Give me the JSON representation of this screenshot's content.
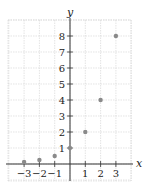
{
  "chart_data": {
    "type": "scatter",
    "title": "",
    "xlabel": "x",
    "ylabel": "y",
    "x": [
      -3,
      -2,
      -1,
      0,
      1,
      2,
      3
    ],
    "y": [
      0.125,
      0.25,
      0.5,
      1,
      2,
      4,
      8
    ],
    "series": [
      {
        "name": "y = 2^x",
        "x": [
          -3,
          -2,
          -1,
          0,
          1,
          2,
          3
        ],
        "values": [
          0.125,
          0.25,
          0.5,
          1,
          2,
          4,
          8
        ]
      }
    ],
    "x_ticks": [
      -3,
      -2,
      -1,
      1,
      2,
      3
    ],
    "y_ticks": [
      1,
      2,
      3,
      4,
      5,
      6,
      7,
      8
    ],
    "xlim": [
      -4.1,
      4
    ],
    "ylim": [
      -1,
      9
    ],
    "grid": true,
    "legend": "none",
    "colors": {
      "point": "#8a8a8a",
      "axis": "#333333",
      "grid": "#d8d8d8"
    }
  },
  "axes": {
    "x_label": "x",
    "y_label": "y"
  }
}
